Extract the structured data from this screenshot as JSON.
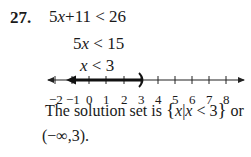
{
  "problem": {
    "number": "27.",
    "steps": [
      {
        "lhs_coef": "5",
        "lhs_var": "x",
        "lhs_rest": "+11 < 26"
      },
      {
        "lhs_coef": "5",
        "lhs_var": "x",
        "lhs_rest": " < 15"
      },
      {
        "lhs_coef": "",
        "lhs_var": "x",
        "lhs_rest": " < 3"
      }
    ]
  },
  "number_line": {
    "tick_labels": [
      "−2",
      "−1",
      "0",
      "1",
      "2",
      "3",
      "4",
      "5",
      "6",
      "7",
      "8"
    ],
    "open_endpoint": "3",
    "shaded_direction": "left",
    "endpoint_symbol": ")"
  },
  "solution": {
    "prefix": "The solution set is ",
    "set_open": "{",
    "set_var": "x",
    "set_bar": "|",
    "set_cond_var": "x",
    "set_cond_rest": " < 3",
    "set_close": "}",
    "or": " or",
    "interval": "(−∞,3)."
  }
}
